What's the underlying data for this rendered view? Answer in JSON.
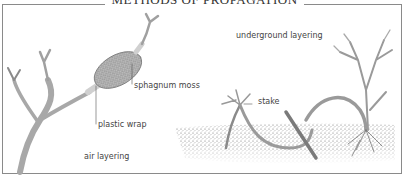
{
  "title": "METHODS OF PROPAGATION",
  "panels": {
    "left": {
      "caption": "air layering",
      "labels": {
        "moss": "sphagnum moss",
        "wrap": "plastic wrap"
      }
    },
    "right": {
      "caption": "underground layering",
      "labels": {
        "stake": "stake"
      }
    }
  },
  "colors": {
    "border": "#8a8a8a",
    "stem": "#9a9a9a",
    "soil": "#6a6a6a",
    "text": "#444444"
  }
}
